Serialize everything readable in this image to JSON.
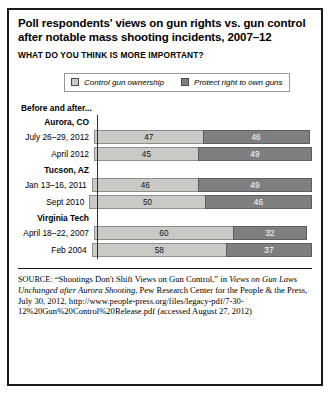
{
  "title": "Poll respondents' views on gun rights vs. gun control after notable mass shooting incidents, 2007–12",
  "subtitle": "WHAT DO YOU THINK IS MORE IMPORTANT?",
  "before_after_label": "Before and after...",
  "legend": [
    {
      "label": "Control gun ownership",
      "color": "#c9c9c5"
    },
    {
      "label": "Protect right to own guns",
      "color": "#7f7f7f"
    }
  ],
  "source": {
    "kicker": "SOURCE:",
    "text_1": "“Shootings Don't Shift Views on Gun Control,” in ",
    "italic_1": "Views on Gun Laws Unchanged after Aurora Shooting",
    "text_2": ", Pew Research Center for the People & the Press, July 30, 2012, http://www.people-press.org/files/legacy-pdf/7-30-12%20Gun%20Control%20Release.pdf (accessed August 27, 2012)"
  },
  "chart_data": {
    "type": "bar",
    "subtype": "stacked-horizontal",
    "title": "Poll respondents' views on gun rights vs. gun control after notable mass shooting incidents, 2007–12",
    "subtitle": "WHAT DO YOU THINK IS MORE IMPORTANT?",
    "xlabel": "",
    "ylabel": "",
    "xlim": [
      0,
      100
    ],
    "grid": false,
    "legend_position": "top",
    "series": [
      {
        "name": "Control gun ownership",
        "color": "#c9c9c5"
      },
      {
        "name": "Protect right to own guns",
        "color": "#7f7f7f"
      }
    ],
    "groups": [
      {
        "name": "Aurora, CO",
        "rows": [
          {
            "category": "July 26–29, 2012",
            "values": [
              47,
              46
            ]
          },
          {
            "category": "April 2012",
            "values": [
              45,
              49
            ]
          }
        ]
      },
      {
        "name": "Tucson, AZ",
        "rows": [
          {
            "category": "Jan 13–16, 2011",
            "values": [
              46,
              49
            ]
          },
          {
            "category": "Sept 2010",
            "values": [
              50,
              46
            ]
          }
        ]
      },
      {
        "name": "Virginia Tech",
        "rows": [
          {
            "category": "April 18–22, 2007",
            "values": [
              60,
              32
            ]
          },
          {
            "category": "Feb 2004",
            "values": [
              58,
              37
            ]
          }
        ]
      }
    ]
  }
}
